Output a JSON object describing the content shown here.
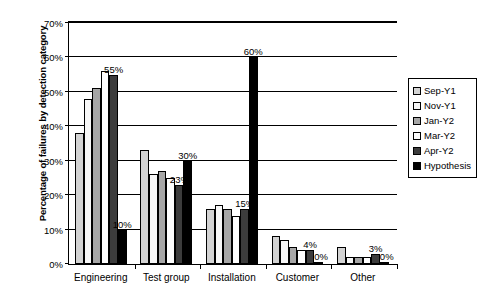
{
  "chart_data": {
    "type": "bar",
    "title": "",
    "xlabel": "",
    "ylabel": "Percentage of failures by detection category",
    "ylim": [
      0,
      70
    ],
    "y_tick_labels": [
      "0%",
      "10%",
      "20%",
      "30%",
      "40%",
      "50%",
      "60%",
      "70%"
    ],
    "y_ticks": [
      0,
      10,
      20,
      30,
      40,
      50,
      60,
      70
    ],
    "grid": true,
    "legend_position": "right",
    "categories": [
      "Engineering",
      "Test group",
      "Installation",
      "Customer",
      "Other"
    ],
    "series": [
      {
        "name": "Sep-Y1",
        "color": "#d3d3d3",
        "values": [
          38,
          33,
          16,
          8,
          5
        ]
      },
      {
        "name": "Nov-Y1",
        "color": "#f7f7f7",
        "values": [
          48,
          26,
          17,
          7,
          2
        ]
      },
      {
        "name": "Jan-Y2",
        "color": "#a6a6a6",
        "values": [
          51,
          27,
          16,
          5,
          2
        ]
      },
      {
        "name": "Mar-Y2",
        "color": "#fdfdfd",
        "values": [
          56,
          25,
          14,
          4,
          2
        ]
      },
      {
        "name": "Apr-Y2",
        "color": "#3c3c3c",
        "values": [
          55,
          23,
          16,
          4,
          3
        ]
      },
      {
        "name": "Hypothesis",
        "color": "#000000",
        "values": [
          10,
          30,
          60,
          0,
          0
        ]
      }
    ],
    "annotations": [
      {
        "text": "55%",
        "category": "Engineering",
        "series": "Apr-Y2"
      },
      {
        "text": "10%",
        "category": "Engineering",
        "series": "Hypothesis"
      },
      {
        "text": "23%",
        "category": "Test group",
        "series": "Apr-Y2"
      },
      {
        "text": "30%",
        "category": "Test group",
        "series": "Hypothesis"
      },
      {
        "text": "15%",
        "category": "Installation",
        "series": "Apr-Y2"
      },
      {
        "text": "60%",
        "category": "Installation",
        "series": "Hypothesis"
      },
      {
        "text": "4%",
        "category": "Customer",
        "series": "Apr-Y2"
      },
      {
        "text": "0%",
        "category": "Customer",
        "series": "Hypothesis"
      },
      {
        "text": "3%",
        "category": "Other",
        "series": "Apr-Y2"
      },
      {
        "text": "0%",
        "category": "Other",
        "series": "Hypothesis"
      }
    ]
  },
  "legend": {
    "items": [
      {
        "label": "Sep-Y1"
      },
      {
        "label": "Nov-Y1"
      },
      {
        "label": "Jan-Y2"
      },
      {
        "label": "Mar-Y2"
      },
      {
        "label": "Apr-Y2"
      },
      {
        "label": "Hypothesis"
      }
    ]
  }
}
